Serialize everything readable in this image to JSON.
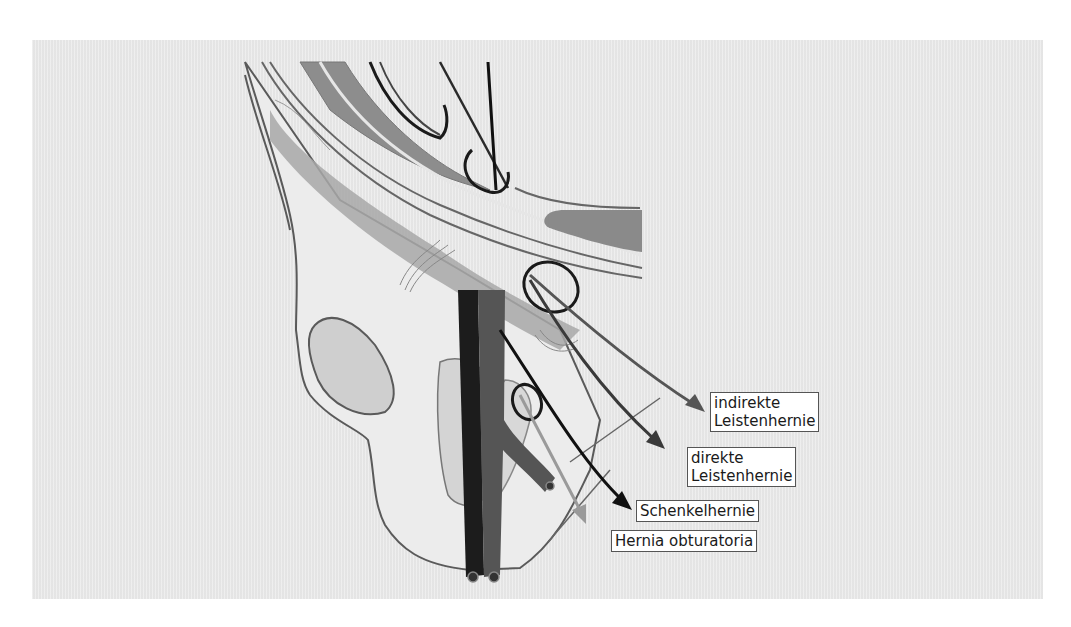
{
  "figure": {
    "panel_color": "#e9e9e9",
    "labels": [
      {
        "id": "indirect",
        "lines": [
          "indirekte",
          "Leistenhernie"
        ]
      },
      {
        "id": "direct",
        "lines": [
          "direkte",
          "Leistenhernie"
        ]
      },
      {
        "id": "femoral",
        "lines": [
          "Schenkelhernie"
        ]
      },
      {
        "id": "obturator",
        "lines": [
          "Hernia obturatoria"
        ]
      }
    ],
    "arrow_colors": {
      "indirect": "#555555",
      "direct": "#3a3a3a",
      "femoral": "#111111",
      "obturator": "#9a9a9a"
    }
  }
}
